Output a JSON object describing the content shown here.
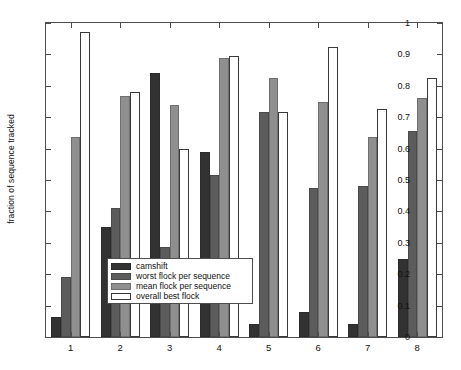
{
  "chart_data": {
    "type": "bar",
    "title": "",
    "xlabel": "",
    "ylabel": "fraction of sequence tracked",
    "categories": [
      "1",
      "2",
      "3",
      "4",
      "5",
      "6",
      "7",
      "8"
    ],
    "ylim": [
      0,
      1
    ],
    "yticks": [
      "0",
      "0.1",
      "0.2",
      "0.3",
      "0.4",
      "0.5",
      "0.6",
      "0.7",
      "0.8",
      "0.9",
      "1"
    ],
    "ytick_values": [
      0,
      0.1,
      0.2,
      0.3,
      0.4,
      0.5,
      0.6,
      0.7,
      0.8,
      0.9,
      1
    ],
    "grid": false,
    "legend_position": "lower-center-left",
    "series": [
      {
        "name": "camshift",
        "color": "#323232",
        "values": [
          0.065,
          0.35,
          0.84,
          0.59,
          0.04,
          0.08,
          0.042,
          0.247
        ]
      },
      {
        "name": "worst flock per sequence",
        "color": "#5c5c5c",
        "values": [
          0.19,
          0.41,
          0.288,
          0.515,
          0.717,
          0.474,
          0.48,
          0.657
        ]
      },
      {
        "name": "mean flock per sequence",
        "color": "#8f8f8f",
        "values": [
          0.637,
          0.767,
          0.74,
          0.889,
          0.826,
          0.75,
          0.638,
          0.76
        ]
      },
      {
        "name": "overall best flock",
        "color": "#ffffff",
        "values": [
          0.971,
          0.78,
          0.6,
          0.894,
          0.717,
          0.924,
          0.727,
          0.824
        ]
      }
    ]
  }
}
